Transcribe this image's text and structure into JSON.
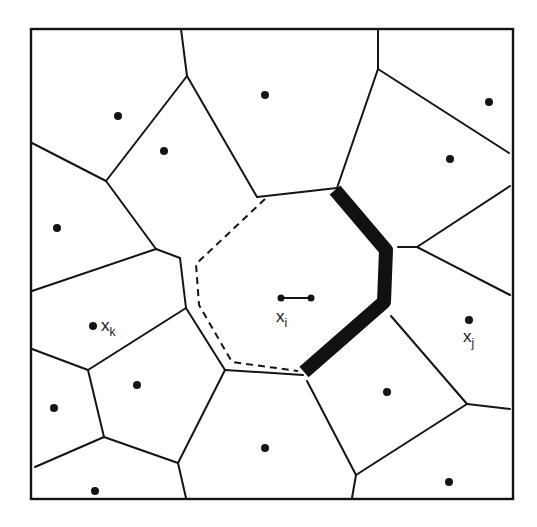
{
  "diagram": {
    "type": "voronoi-tessellation",
    "colors": {
      "ink": "#141414",
      "background": "#ffffff"
    },
    "labels": {
      "xi": {
        "base": "x",
        "sub": "i"
      },
      "xj": {
        "base": "x",
        "sub": "j"
      },
      "xk": {
        "base": "x",
        "sub": "k"
      }
    },
    "sites": [
      {
        "name": "site-top-left",
        "x": 118,
        "y": 116
      },
      {
        "name": "site-upper-left",
        "x": 164,
        "y": 151
      },
      {
        "name": "site-left",
        "x": 57,
        "y": 228
      },
      {
        "name": "site-xk",
        "x": 93,
        "y": 326
      },
      {
        "name": "site-lower-left",
        "x": 137,
        "y": 385
      },
      {
        "name": "site-bottom-left-edge",
        "x": 54,
        "y": 408
      },
      {
        "name": "site-bottom-left-corner",
        "x": 95,
        "y": 491
      },
      {
        "name": "site-top-center",
        "x": 265,
        "y": 95
      },
      {
        "name": "site-top-right",
        "x": 489,
        "y": 102
      },
      {
        "name": "site-upper-right",
        "x": 450,
        "y": 159
      },
      {
        "name": "site-xj",
        "x": 469,
        "y": 320
      },
      {
        "name": "site-lower-right",
        "x": 387,
        "y": 392
      },
      {
        "name": "site-bottom-center",
        "x": 265,
        "y": 448
      },
      {
        "name": "site-bottom-right",
        "x": 449,
        "y": 482
      }
    ],
    "xi_segment": {
      "x1": 281,
      "y1": 298,
      "x2": 311,
      "y2": 298
    }
  }
}
